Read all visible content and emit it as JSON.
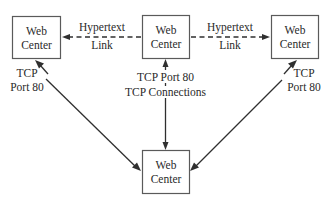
{
  "diagram": {
    "nodes": [
      {
        "id": "left",
        "line1": "Web",
        "line2": "Center"
      },
      {
        "id": "middle",
        "line1": "Web",
        "line2": "Center"
      },
      {
        "id": "right",
        "line1": "Web",
        "line2": "Center"
      },
      {
        "id": "bottom",
        "line1": "Web",
        "line2": "Center"
      }
    ],
    "edges": {
      "middle_to_left": {
        "style": "dashed",
        "label_top": "Hypertext",
        "label_bottom": "Link"
      },
      "middle_to_right": {
        "style": "dashed",
        "label_top": "Hypertext",
        "label_bottom": "Link"
      },
      "bottom_to_left": {
        "style": "solid",
        "label_top": "TCP",
        "label_bottom": "Port 80"
      },
      "bottom_to_middle": {
        "style": "solid-bidirectional",
        "label_top": "TCP Port 80",
        "label_bottom": "TCP Connections"
      },
      "bottom_to_right": {
        "style": "solid",
        "label_top": "TCP",
        "label_bottom": "Port 80"
      }
    },
    "colors": {
      "line": "#2f2f2f",
      "box_border": "#5a5a5a",
      "text": "#2a2a2a",
      "background": "#ffffff"
    }
  }
}
